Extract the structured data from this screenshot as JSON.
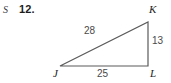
{
  "page": {
    "background_color": "#ffffff",
    "width": 171,
    "height": 83
  },
  "exercise": {
    "section_mark": "S",
    "number": "12."
  },
  "figure": {
    "type": "right-triangle",
    "stroke_color": "#5a5a5a",
    "label_color": "#4a4a4a",
    "vertices": [
      {
        "name": "J",
        "label": "J",
        "x": 60,
        "y": 66
      },
      {
        "name": "K",
        "label": "K",
        "x": 148,
        "y": 22
      },
      {
        "name": "L",
        "label": "L",
        "x": 148,
        "y": 66
      }
    ],
    "sides": [
      {
        "name": "JK",
        "label": "28",
        "description": "hypotenuse"
      },
      {
        "name": "KL",
        "label": "13",
        "description": "vertical-leg"
      },
      {
        "name": "JL",
        "label": "25",
        "description": "horizontal-leg"
      }
    ]
  }
}
